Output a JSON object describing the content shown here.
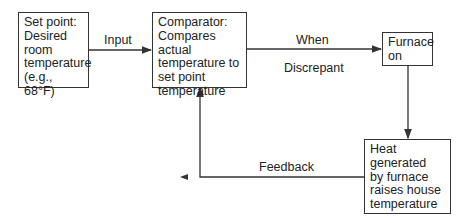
{
  "diagram": {
    "type": "feedback-loop flowchart",
    "nodes": [
      {
        "id": "set_point",
        "lines": [
          "Set point:",
          "Desired",
          "room",
          "temperature",
          "(e.g., 68°F)"
        ]
      },
      {
        "id": "comparator",
        "lines": [
          "Comparator:",
          "Compares actual",
          "temperature to",
          "set point",
          "temperature"
        ]
      },
      {
        "id": "furnace",
        "lines": [
          "Furnace",
          "on"
        ]
      },
      {
        "id": "heat",
        "lines": [
          "Heat",
          "generated",
          "by furnace",
          "raises house",
          "temperature"
        ]
      }
    ],
    "edges": [
      {
        "from": "set_point",
        "to": "comparator",
        "label": "Input"
      },
      {
        "from": "comparator",
        "to": "furnace",
        "label_top": "When",
        "label_bottom": "Discrepant"
      },
      {
        "from": "furnace",
        "to": "heat",
        "label": ""
      },
      {
        "from": "heat",
        "to": "comparator",
        "label": "Feedback"
      }
    ]
  },
  "colors": {
    "line": "#333333",
    "text": "#222222",
    "background": "#ffffff"
  }
}
